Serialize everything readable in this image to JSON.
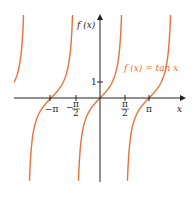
{
  "chart_data": {
    "type": "line",
    "title": "",
    "function": "tan x",
    "xlabel": "x",
    "ylabel": "f(x)",
    "annotation": "f(x) = tan x",
    "x_ticks": [
      "−π",
      "−π/2",
      "π/2",
      "π"
    ],
    "y_ticks": [
      "1"
    ],
    "xlim": [
      -6.4,
      6.0
    ],
    "ylim": [
      -5.2,
      5.2
    ],
    "asymptotes": [
      "-3π/2",
      "-π/2",
      "π/2",
      "3π/2"
    ],
    "grid": false,
    "line_color": "#e8703a",
    "series": [
      {
        "name": "tan x",
        "x": [
          -3.1416,
          -0.7854,
          0,
          0.7854,
          3.1416
        ],
        "y": [
          0,
          -1,
          0,
          1,
          0
        ]
      }
    ]
  },
  "labels": {
    "fx": "f (x)",
    "x": "x",
    "one": "1",
    "neg_pi": "−π",
    "pi": "π",
    "fn": "f (x) = tan x"
  }
}
